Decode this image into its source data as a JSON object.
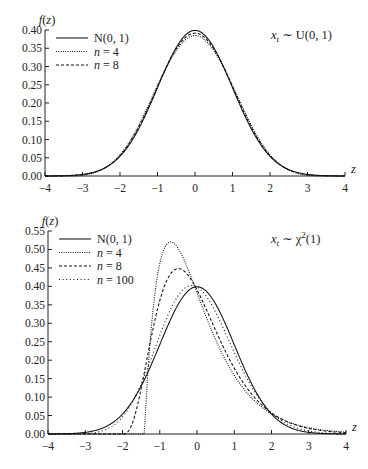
{
  "chart_data": [
    {
      "type": "line",
      "title": "",
      "annotation": "x_t ~ U(0,1)",
      "annotation_display": {
        "var": "x",
        "sub": "t",
        "rel": " ∼ ",
        "dist": "U(0, 1)"
      },
      "ylabel": "f(z)",
      "xlabel": "z",
      "xlim": [
        -4,
        4
      ],
      "ylim": [
        0,
        0.4
      ],
      "xticks": [
        -4,
        -3,
        -2,
        -1,
        0,
        1,
        2,
        3,
        4
      ],
      "yticks": [
        0.0,
        0.05,
        0.1,
        0.15,
        0.2,
        0.25,
        0.3,
        0.35,
        0.4
      ],
      "grid": false,
      "legend_position": "upper left",
      "series": [
        {
          "name": "N(0,1)",
          "label_display": "N(0, 1)",
          "style": "solid",
          "peak": {
            "x": 0,
            "y": 0.399
          }
        },
        {
          "name": "n = 4",
          "label_display": "n = 4",
          "style": "dotted",
          "peak": {
            "x": 0,
            "y": 0.394
          }
        },
        {
          "name": "n = 8",
          "label_display": "n = 8",
          "style": "dashed",
          "peak": {
            "x": 0,
            "y": 0.397
          }
        }
      ]
    },
    {
      "type": "line",
      "title": "",
      "annotation": "x_t ~ χ²(1)",
      "annotation_display": {
        "var": "x",
        "sub": "t",
        "rel": " ∼ ",
        "dist": "χ",
        "sup": "2",
        "arg": "(1)"
      },
      "ylabel": "f(z)",
      "xlabel": "z",
      "xlim": [
        -4,
        4
      ],
      "ylim": [
        0,
        0.55
      ],
      "xticks": [
        -4,
        -3,
        -2,
        -1,
        0,
        1,
        2,
        3,
        4
      ],
      "yticks": [
        0.0,
        0.05,
        0.1,
        0.15,
        0.2,
        0.25,
        0.3,
        0.35,
        0.4,
        0.45,
        0.5,
        0.55
      ],
      "grid": false,
      "legend_position": "upper left",
      "series": [
        {
          "name": "N(0,1)",
          "label_display": "N(0, 1)",
          "style": "solid",
          "peak": {
            "x": 0,
            "y": 0.399
          }
        },
        {
          "name": "n = 4",
          "label_display": "n = 4",
          "style": "dotted",
          "df": 4,
          "support_start": -1.41,
          "peak": {
            "x": -0.71,
            "y": 0.52
          }
        },
        {
          "name": "n = 8",
          "label_display": "n = 8",
          "style": "dashed",
          "df": 8,
          "support_start": -2.0,
          "peak": {
            "x": -0.5,
            "y": 0.45
          }
        },
        {
          "name": "n = 100",
          "label_display": "n = 100",
          "style": "loose-dotted",
          "df": 100,
          "peak": {
            "x": -0.14,
            "y": 0.41
          }
        }
      ]
    }
  ]
}
